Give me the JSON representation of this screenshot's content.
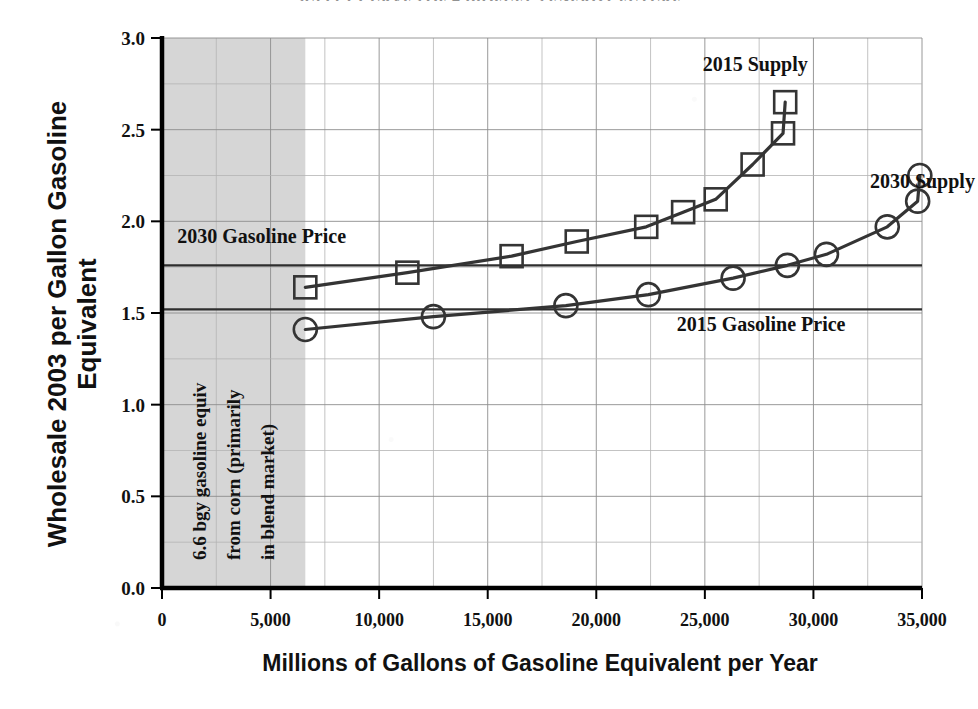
{
  "chart_data": {
    "type": "line",
    "title": "SUPPLY CURVES OF A BIOFUELS ENERGY FUTURE",
    "xlabel": "Millions of Gallons of Gasoline Equivalent per Year",
    "ylabel": "Wholesale 2003 per Gallon Gasoline Equivalent",
    "xlim": [
      0,
      35000
    ],
    "ylim": [
      0.0,
      3.0
    ],
    "grid": true,
    "grid_x_step": 2500,
    "grid_y_step": 0.25,
    "legend_position": "inline-annotations",
    "xticks": [
      0,
      5000,
      10000,
      15000,
      20000,
      25000,
      30000,
      35000
    ],
    "xtick_labels": [
      "0",
      "5,000",
      "10,000",
      "15,000",
      "20,000",
      "25,000",
      "30,000",
      "35,000"
    ],
    "yticks": [
      0.0,
      0.5,
      1.0,
      1.5,
      2.0,
      2.5,
      3.0
    ],
    "ytick_labels": [
      "0.0",
      "0.5",
      "1.0",
      "1.5",
      "2.0",
      "2.5",
      "3.0"
    ],
    "series": [
      {
        "name": "2015 Supply",
        "marker": "square",
        "x": [
          6600,
          11300,
          16100,
          19100,
          22300,
          24000,
          25500,
          27200,
          28600,
          28700
        ],
        "y": [
          1.64,
          1.72,
          1.81,
          1.89,
          1.97,
          2.05,
          2.12,
          2.31,
          2.48,
          2.65
        ]
      },
      {
        "name": "2030 Supply",
        "marker": "circle",
        "x": [
          6600,
          12500,
          18600,
          22400,
          26300,
          28800,
          30600,
          33400,
          34800,
          34900
        ],
        "y": [
          1.41,
          1.48,
          1.54,
          1.6,
          1.69,
          1.76,
          1.82,
          1.97,
          2.11,
          2.25
        ]
      }
    ],
    "reference_lines": [
      {
        "label": "2030 Gasoline Price",
        "value": 1.76,
        "orientation": "horizontal"
      },
      {
        "label": "2015 Gasoline Price",
        "value": 1.52,
        "orientation": "horizontal"
      }
    ],
    "shaded_region": {
      "label": "6.6 bgy gasoline equiv from corn (primarily in blend market)",
      "x_start": 0,
      "x_end": 6600,
      "color": "#d6d6d6"
    },
    "annotations": [
      {
        "text": "2015 Supply",
        "x": 24900,
        "y": 2.82
      },
      {
        "text": "2030 Supply",
        "x": 32600,
        "y": 2.18
      },
      {
        "text": "2030 Gasoline Price",
        "x": 700,
        "y": 1.88
      },
      {
        "text": "2015 Gasoline Price",
        "x": 23700,
        "y": 1.4
      }
    ]
  },
  "colors": {
    "series_stroke": "#343434",
    "shade_fill": "#d6d6d6",
    "grid": "#8d8d8d",
    "axis": "#000000"
  }
}
